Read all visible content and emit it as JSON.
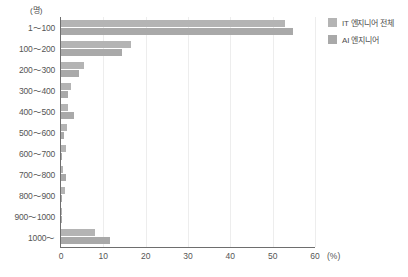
{
  "chart_data": {
    "type": "bar",
    "orientation": "horizontal",
    "title": "",
    "subtitle": "",
    "xlabel": "(%)",
    "ylabel": "(명)",
    "xlim": [
      0,
      60
    ],
    "xticks": [
      0,
      10,
      20,
      30,
      40,
      50,
      60
    ],
    "xtick_labels": [
      "0",
      "10",
      "20",
      "30",
      "40",
      "50",
      "60"
    ],
    "grid": true,
    "grid_axis": "x",
    "legend_position": "right-top",
    "categories": [
      "1～100",
      "100～200",
      "200～300",
      "300～400",
      "400～500",
      "500～600",
      "600～700",
      "700～800",
      "800～900",
      "900～1000",
      "1000～"
    ],
    "series": [
      {
        "name": "IT 엔지니어 전체",
        "color": "#b4b4b4",
        "values": [
          52.8,
          16.6,
          5.5,
          2.4,
          1.6,
          1.3,
          1.1,
          0.5,
          0.9,
          0.2,
          8.1
        ]
      },
      {
        "name": "AI 엔지니어",
        "color": "#a9a9a9",
        "values": [
          54.9,
          14.5,
          4.2,
          1.6,
          3.0,
          0.7,
          0.3,
          1.2,
          0.3,
          0.1,
          11.6
        ]
      }
    ]
  },
  "legend": {
    "items": [
      {
        "label": "IT 엔지니어 전체",
        "color": "#b4b4b4"
      },
      {
        "label": "AI 엔지니어",
        "color": "#a9a9a9"
      }
    ]
  },
  "axis": {
    "y_unit": "(명)",
    "x_unit": "(%)"
  }
}
